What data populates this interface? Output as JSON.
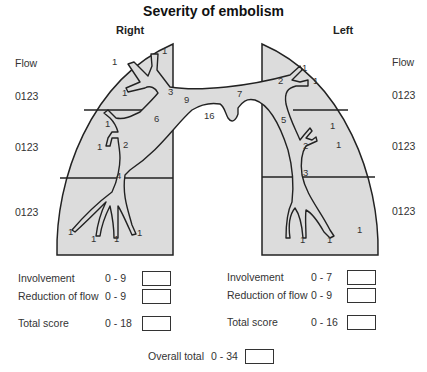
{
  "title": "Severity of embolism",
  "right": {
    "label": "Right",
    "flow_label": "Flow",
    "flow_scales": [
      "0123",
      "0123",
      "0123"
    ],
    "segment_labels": [
      "1",
      "1",
      "1",
      "3",
      "9",
      "6",
      "1",
      "1",
      "2",
      "4",
      "1",
      "1",
      "1",
      "1"
    ],
    "scores": [
      {
        "label": "Involvement",
        "range": "0 - 9",
        "value": ""
      },
      {
        "label": "Reduction of flow",
        "range": "0 - 9",
        "value": ""
      },
      {
        "label": "Total score",
        "range": "0 - 18",
        "value": ""
      }
    ]
  },
  "left": {
    "label": "Left",
    "flow_label": "Flow",
    "flow_scales": [
      "0123",
      "0123",
      "0123"
    ],
    "segment_labels": [
      "1",
      "1",
      "2",
      "7",
      "5",
      "1",
      "1",
      "2",
      "3",
      "1",
      "1",
      "1"
    ],
    "scores": [
      {
        "label": "Involvement",
        "range": "0 - 7",
        "value": ""
      },
      {
        "label": "Reduction of flow",
        "range": "0 - 9",
        "value": ""
      },
      {
        "label": "Total score",
        "range": "0 - 16",
        "value": ""
      }
    ]
  },
  "trunk_label": "16",
  "overall": {
    "label": "Overall total",
    "range": "0 - 34",
    "value": ""
  },
  "colors": {
    "lung_fill": "#dcdcdc",
    "outline": "#222222",
    "background": "#ffffff"
  }
}
